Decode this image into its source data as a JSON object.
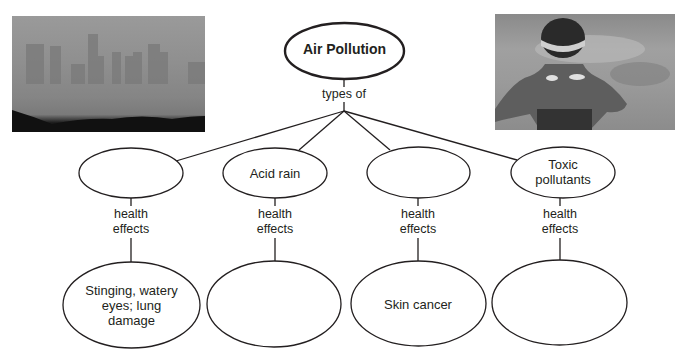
{
  "diagram": {
    "root": {
      "label": "Air Pollution"
    },
    "root_link_label": "types of",
    "types": [
      {
        "label": "",
        "link_label": "health effects",
        "effect": "Stinging, watery eyes; lung damage"
      },
      {
        "label": "Acid rain",
        "link_label": "health effects",
        "effect": ""
      },
      {
        "label": "",
        "link_label": "health effects",
        "effect": "Skin cancer"
      },
      {
        "label": "Toxic pollutants",
        "link_label": "health effects",
        "effect": ""
      }
    ]
  },
  "images": [
    {
      "name": "smoggy city skyline photo"
    },
    {
      "name": "sunburned swimmer photo"
    }
  ],
  "colors": {
    "line": "#231f20",
    "background": "#ffffff"
  }
}
